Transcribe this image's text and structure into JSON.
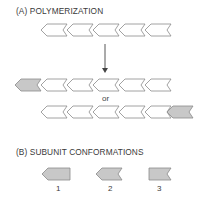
{
  "section_a": {
    "title": "(A) POLYMERIZATION",
    "or_label": "or",
    "rows": [
      {
        "name": "initial-filament",
        "units": [
          "white",
          "white",
          "white",
          "white",
          "white"
        ]
      },
      {
        "name": "result-minus-end-addition",
        "units": [
          "grey",
          "white",
          "white",
          "white",
          "white",
          "white"
        ]
      },
      {
        "name": "result-plus-end-addition",
        "units": [
          "white",
          "white",
          "white",
          "white",
          "white",
          "grey"
        ]
      }
    ]
  },
  "section_b": {
    "title": "(B) SUBUNIT CONFORMATIONS",
    "conformations": [
      {
        "label": "1",
        "shape": "pointed-front-flat-back"
      },
      {
        "label": "2",
        "shape": "pointed-front-notched-back"
      },
      {
        "label": "3",
        "shape": "flat-front-notched-back"
      }
    ]
  },
  "colors": {
    "outline": "#8a8a8a",
    "subunit_fill": "#ffffff",
    "highlight_fill": "#c8c8c8",
    "text": "#3a3a3a"
  }
}
